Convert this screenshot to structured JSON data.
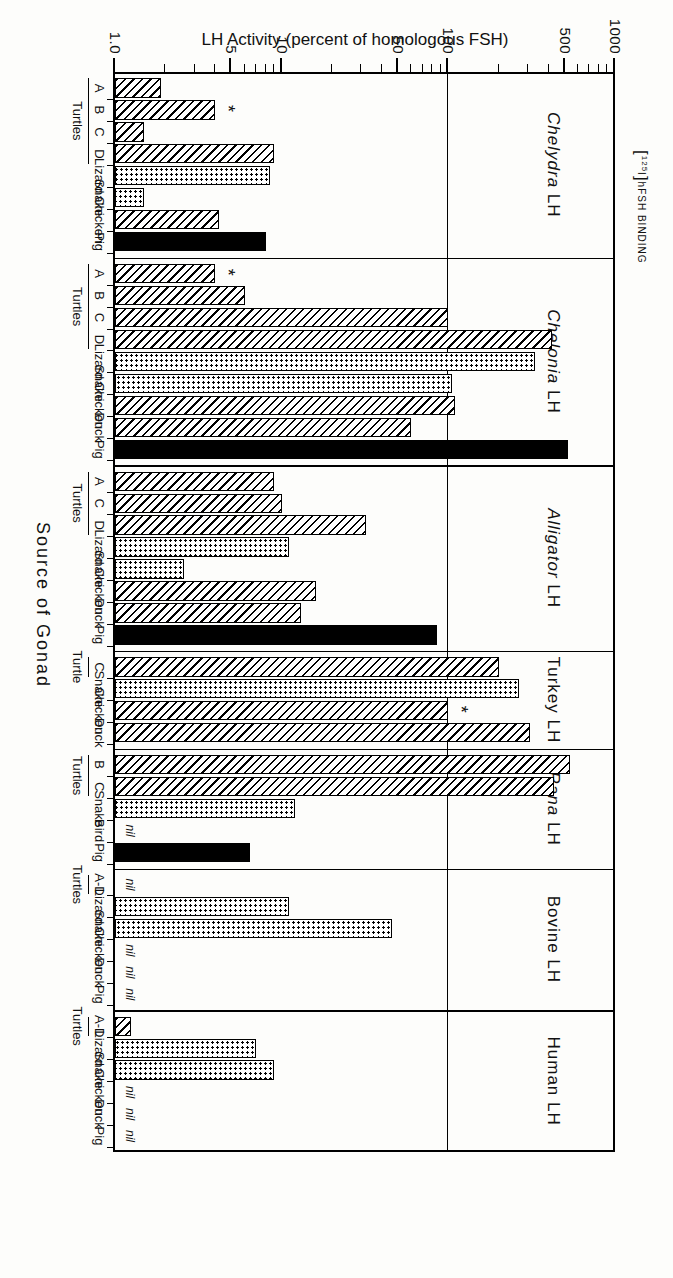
{
  "figure": {
    "binding_label_bracket_open": "[",
    "binding_label_isotope": "125",
    "binding_label_iodine": "I",
    "binding_label_bracket_close": "]",
    "binding_label_text": "hFSH BINDING",
    "x_axis_title": "Source  of  Gonad",
    "y_axis_title": "LH Activity (percent of homologous FSH)"
  },
  "axis": {
    "labels": [
      "1000",
      "500",
      "100",
      "50",
      "10",
      "5",
      "1.0"
    ],
    "values": [
      1000,
      500,
      100,
      50,
      10,
      5,
      1.0
    ],
    "min": 1.0,
    "max": 1000,
    "reference_line_value": 100,
    "scale": "log"
  },
  "legend_note": {
    "asterisk": "*",
    "nil": "nil"
  },
  "chart_data": {
    "type": "bar",
    "xlabel": "Source  of  Gonad",
    "ylabel": "LH Activity (percent of homologous FSH)",
    "yscale": "log",
    "ylim": [
      1.0,
      1000
    ],
    "ytick_labels": [
      "1000",
      "500",
      "100",
      "50",
      "10",
      "5",
      "1.0"
    ],
    "ytick_values": [
      1000,
      500,
      100,
      50,
      10,
      5,
      1.0
    ],
    "reference_line": 100,
    "grid": false,
    "legend": "none",
    "orientation": "horizontal-bars-rotated",
    "fill_key": {
      "hatch": "turtle / bird (diagonal hatch)",
      "dots": "lizard / snake (stippled)",
      "solid": "pig (solid black)"
    },
    "panels": [
      {
        "name": "Chelydra LH",
        "name_italic": "Chelydra",
        "name_roman": "LH",
        "bars": [
          {
            "label": "A",
            "group": "Turtles",
            "value": 1.9,
            "fill": "hatch",
            "star": false
          },
          {
            "label": "B",
            "group": "Turtles",
            "value": 4.0,
            "fill": "hatch",
            "star": true
          },
          {
            "label": "C",
            "group": "Turtles",
            "value": 1.5,
            "fill": "hatch",
            "star": false
          },
          {
            "label": "D",
            "group": "Turtles",
            "value": 9.0,
            "fill": "hatch",
            "star": false
          },
          {
            "label": "Lizard",
            "value": 8.5,
            "fill": "dots",
            "star": false
          },
          {
            "label": "Snake",
            "value": 1.5,
            "fill": "dots",
            "star": false
          },
          {
            "label": "Chicken",
            "value": 4.2,
            "fill": "hatch",
            "star": false
          },
          {
            "label": "Pig",
            "value": 8.0,
            "fill": "solid",
            "star": false
          }
        ]
      },
      {
        "name": "Chelonia LH",
        "name_italic": "Chelonia",
        "name_roman": "LH",
        "bars": [
          {
            "label": "A",
            "group": "Turtles",
            "value": 4.0,
            "fill": "hatch",
            "star": true
          },
          {
            "label": "B",
            "group": "Turtles",
            "value": 6.0,
            "fill": "hatch",
            "star": false
          },
          {
            "label": "C",
            "group": "Turtles",
            "value": 100,
            "fill": "hatch",
            "star": false
          },
          {
            "label": "D",
            "group": "Turtles",
            "value": 420,
            "fill": "hatch",
            "star": false
          },
          {
            "label": "Lizard",
            "value": 330,
            "fill": "dots",
            "star": false
          },
          {
            "label": "Snake",
            "value": 105,
            "fill": "dots",
            "star": false
          },
          {
            "label": "Chicken",
            "value": 110,
            "fill": "hatch",
            "star": false
          },
          {
            "label": "Duck",
            "value": 60,
            "fill": "hatch",
            "star": false
          },
          {
            "label": "Pig",
            "value": 520,
            "fill": "solid",
            "star": false
          }
        ]
      },
      {
        "name": "Alligator LH",
        "name_italic": "Alligator",
        "name_roman": "LH",
        "bars": [
          {
            "label": "A",
            "group": "Turtles",
            "value": 9.0,
            "fill": "hatch",
            "star": false
          },
          {
            "label": "C",
            "group": "Turtles",
            "value": 10,
            "fill": "hatch",
            "star": false
          },
          {
            "label": "D",
            "group": "Turtles",
            "value": 32,
            "fill": "hatch",
            "star": false
          },
          {
            "label": "Lizard",
            "value": 11,
            "fill": "dots",
            "star": false
          },
          {
            "label": "Snake",
            "value": 2.6,
            "fill": "dots",
            "star": false
          },
          {
            "label": "Chicken",
            "value": 16,
            "fill": "hatch",
            "star": false
          },
          {
            "label": "Duck",
            "value": 13,
            "fill": "hatch",
            "star": false
          },
          {
            "label": "Pig",
            "value": 85,
            "fill": "solid",
            "star": false
          }
        ]
      },
      {
        "name": "Turkey LH",
        "name_italic": "",
        "name_roman": "Turkey LH",
        "bars": [
          {
            "label": "C",
            "group": "Turtle",
            "value": 200,
            "fill": "hatch",
            "star": false
          },
          {
            "label": "Snake",
            "value": 265,
            "fill": "dots",
            "star": false
          },
          {
            "label": "Chicken",
            "value": 100,
            "fill": "hatch",
            "star": true
          },
          {
            "label": "Duck",
            "value": 310,
            "fill": "hatch",
            "star": false
          }
        ]
      },
      {
        "name": "Rana LH",
        "name_italic": "Rana",
        "name_roman": "LH",
        "bars": [
          {
            "label": "B",
            "group": "Turtles",
            "value": 540,
            "fill": "hatch",
            "star": false
          },
          {
            "label": "C",
            "group": "Turtles",
            "value": 430,
            "fill": "hatch",
            "star": false
          },
          {
            "label": "Snake",
            "value": 12,
            "fill": "dots",
            "star": false
          },
          {
            "label": "Bird",
            "value": 0,
            "nil": true,
            "fill": "none",
            "star": false
          },
          {
            "label": "Pig",
            "value": 6.5,
            "fill": "solid",
            "star": false
          }
        ]
      },
      {
        "name": "Bovine LH",
        "name_italic": "",
        "name_roman": "Bovine LH",
        "bars": [
          {
            "label": "A-D",
            "group": "Turtles",
            "value": 0,
            "nil": true,
            "fill": "none",
            "star": false
          },
          {
            "label": "Lizard",
            "value": 11,
            "fill": "dots",
            "star": false
          },
          {
            "label": "Snake",
            "value": 46,
            "fill": "dots",
            "star": false
          },
          {
            "label": "Chicken",
            "value": 0,
            "nil": true,
            "fill": "none",
            "star": false
          },
          {
            "label": "Duck",
            "value": 0,
            "nil": true,
            "fill": "none",
            "star": false
          },
          {
            "label": "Pig",
            "value": 0,
            "nil": true,
            "fill": "none",
            "star": false
          }
        ]
      },
      {
        "name": "Human LH",
        "name_italic": "",
        "name_roman": "Human LH",
        "bars": [
          {
            "label": "A-D",
            "group": "Turtles",
            "value": 1.25,
            "fill": "hatch",
            "star": false
          },
          {
            "label": "Lizard",
            "value": 7.0,
            "fill": "dots",
            "star": false
          },
          {
            "label": "Snake",
            "value": 9.0,
            "fill": "dots",
            "star": false
          },
          {
            "label": "Chicken",
            "value": 0,
            "nil": true,
            "fill": "none",
            "star": false
          },
          {
            "label": "Duck",
            "value": 0,
            "nil": true,
            "fill": "none",
            "star": false
          },
          {
            "label": "Pig",
            "value": 0,
            "nil": true,
            "fill": "none",
            "star": false
          }
        ]
      }
    ]
  }
}
